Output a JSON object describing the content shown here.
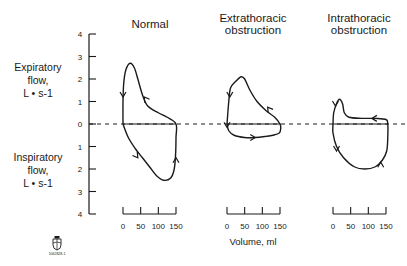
{
  "chart_data": {
    "type": "line",
    "ylabel_top": [
      "Expiratory",
      "flow,",
      "L • s-1"
    ],
    "ylabel_bottom": [
      "Inspiratory",
      "flow,",
      "L • s-1"
    ],
    "xlabel": "Volume, ml",
    "yticks": [
      "4",
      "3",
      "2",
      "1",
      "0",
      "1",
      "2",
      "3",
      "4"
    ],
    "ylim": [
      -4,
      4
    ],
    "xticks": [
      "0",
      "50",
      "100",
      "150"
    ],
    "xlim": [
      0,
      150
    ],
    "zero_line": "dashed",
    "logo_caption": "1062828-1",
    "panels": [
      {
        "name": "Normal",
        "title_lines": [
          "Normal"
        ],
        "loop": [
          [
            0,
            0
          ],
          [
            0,
            1
          ],
          [
            2,
            1.8
          ],
          [
            8,
            2.4
          ],
          [
            20,
            2.7
          ],
          [
            32,
            2.5
          ],
          [
            42,
            2.0
          ],
          [
            55,
            1.3
          ],
          [
            70,
            0.8
          ],
          [
            100,
            0.5
          ],
          [
            125,
            0.3
          ],
          [
            150,
            0
          ],
          [
            150,
            -0.6
          ],
          [
            149,
            -1.3
          ],
          [
            145,
            -2.0
          ],
          [
            135,
            -2.4
          ],
          [
            115,
            -2.5
          ],
          [
            95,
            -2.3
          ],
          [
            75,
            -1.9
          ],
          [
            55,
            -1.5
          ],
          [
            35,
            -1.1
          ],
          [
            15,
            -0.6
          ],
          [
            0,
            0
          ]
        ],
        "arrows": [
          [
            0,
            1.2,
            "down"
          ],
          [
            60,
            1.2,
            "up-left"
          ],
          [
            42,
            -1.5,
            "down-right"
          ],
          [
            150,
            -1.5,
            "up"
          ]
        ]
      },
      {
        "name": "Extrathoracic obstruction",
        "title_lines": [
          "Extrathoracic",
          "obstruction"
        ],
        "loop": [
          [
            0,
            0
          ],
          [
            5,
            1.0
          ],
          [
            10,
            1.6
          ],
          [
            25,
            1.9
          ],
          [
            40,
            2.1
          ],
          [
            50,
            2.0
          ],
          [
            65,
            1.5
          ],
          [
            85,
            1.0
          ],
          [
            110,
            0.6
          ],
          [
            135,
            0.3
          ],
          [
            150,
            0
          ],
          [
            152,
            -0.2
          ],
          [
            148,
            -0.4
          ],
          [
            130,
            -0.5
          ],
          [
            110,
            -0.55
          ],
          [
            80,
            -0.6
          ],
          [
            50,
            -0.6
          ],
          [
            20,
            -0.5
          ],
          [
            5,
            -0.3
          ],
          [
            0,
            0
          ]
        ],
        "arrows": [
          [
            8,
            1.2,
            "down"
          ],
          [
            115,
            0.75,
            "up-left"
          ],
          [
            0,
            -0.15,
            "down"
          ],
          [
            80,
            -0.6,
            "right"
          ]
        ]
      },
      {
        "name": "Intrathoracic obstruction",
        "title_lines": [
          "Intrathoracic",
          "obstruction"
        ],
        "loop": [
          [
            0,
            0
          ],
          [
            2,
            0.5
          ],
          [
            10,
            0.9
          ],
          [
            18,
            1.1
          ],
          [
            27,
            0.9
          ],
          [
            32,
            0.5
          ],
          [
            45,
            0.3
          ],
          [
            80,
            0.25
          ],
          [
            120,
            0.25
          ],
          [
            150,
            0.2
          ],
          [
            155,
            0
          ],
          [
            155,
            -0.6
          ],
          [
            152,
            -1.2
          ],
          [
            140,
            -1.6
          ],
          [
            120,
            -1.9
          ],
          [
            90,
            -2.0
          ],
          [
            60,
            -1.9
          ],
          [
            30,
            -1.5
          ],
          [
            10,
            -1.0
          ],
          [
            0,
            -0.4
          ],
          [
            0,
            0
          ]
        ],
        "arrows": [
          [
            7,
            0.8,
            "down"
          ],
          [
            110,
            0.25,
            "left"
          ],
          [
            10,
            -1.2,
            "down"
          ],
          [
            135,
            -1.7,
            "up"
          ]
        ]
      }
    ]
  }
}
